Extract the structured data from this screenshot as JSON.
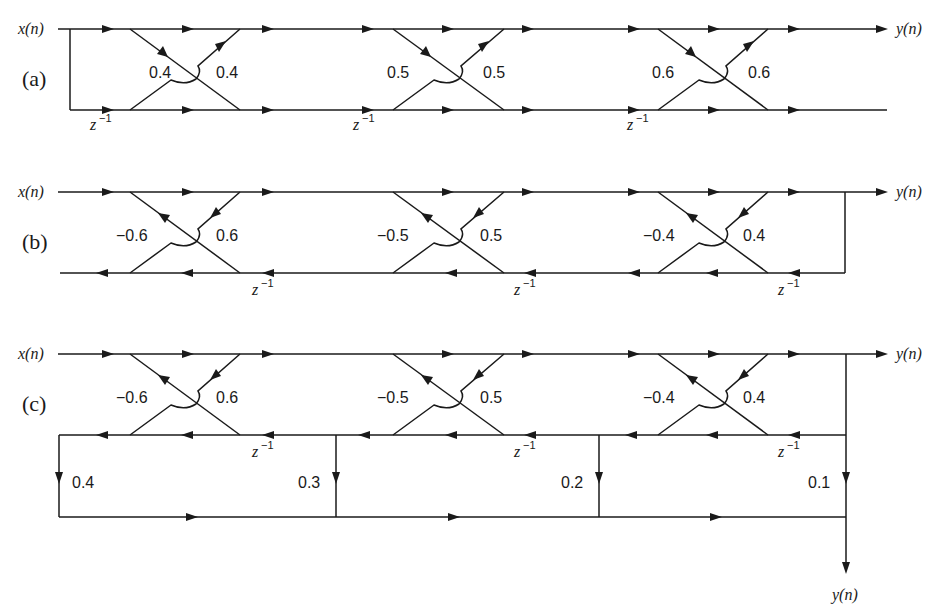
{
  "figure": {
    "input_label": "x(n)",
    "output_label": "y(n)",
    "delay_label": "z",
    "delay_exponent": "−1"
  },
  "sections": [
    {
      "id": "a",
      "label": "(a)",
      "type": "FIR lattice",
      "stages": [
        {
          "k_left": "0.4",
          "k_right": "0.4"
        },
        {
          "k_left": "0.5",
          "k_right": "0.5"
        },
        {
          "k_left": "0.6",
          "k_right": "0.6"
        }
      ]
    },
    {
      "id": "b",
      "label": "(b)",
      "type": "All-pole lattice",
      "stages": [
        {
          "k_left": "−0.6",
          "k_right": "0.6"
        },
        {
          "k_left": "−0.5",
          "k_right": "0.5"
        },
        {
          "k_left": "−0.4",
          "k_right": "0.4"
        }
      ]
    },
    {
      "id": "c",
      "label": "(c)",
      "type": "Lattice-ladder",
      "stages": [
        {
          "k_left": "−0.6",
          "k_right": "0.6"
        },
        {
          "k_left": "−0.5",
          "k_right": "0.5"
        },
        {
          "k_left": "−0.4",
          "k_right": "0.4"
        }
      ],
      "ladder_coefficients": [
        "0.4",
        "0.3",
        "0.2",
        "0.1"
      ]
    }
  ]
}
